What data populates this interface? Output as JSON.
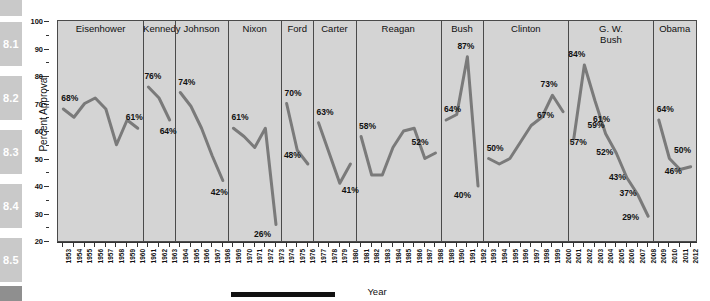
{
  "margin_tabs": [
    {
      "label": "8.1"
    },
    {
      "label": "8.2"
    },
    {
      "label": "8.3"
    },
    {
      "label": "8.4"
    },
    {
      "label": "8.5"
    }
  ],
  "chart_data": {
    "type": "line",
    "title": "",
    "xlabel": "Year",
    "ylabel": "Percent Approval",
    "ylim": [
      20,
      100
    ],
    "yticks": [
      20,
      30,
      40,
      50,
      60,
      70,
      80,
      90,
      100
    ],
    "xlim": [
      1953,
      2012
    ],
    "grid": false,
    "legend": "none",
    "line_color": "#7a7a7a",
    "panel_background": "#d4d4d4",
    "panels": [
      {
        "name": "Eisenhower",
        "start": 1953,
        "end": 1960
      },
      {
        "name": "Kennedy",
        "start": 1961,
        "end": 1963
      },
      {
        "name": "Johnson",
        "start": 1964,
        "end": 1968
      },
      {
        "name": "Nixon",
        "start": 1969,
        "end": 1973
      },
      {
        "name": "Ford",
        "start": 1974,
        "end": 1976
      },
      {
        "name": "Carter",
        "start": 1977,
        "end": 1980
      },
      {
        "name": "Reagan",
        "start": 1981,
        "end": 1988
      },
      {
        "name": "Bush",
        "start": 1989,
        "end": 1992
      },
      {
        "name": "Clinton",
        "start": 1993,
        "end": 2000
      },
      {
        "name": "G. W.\nBush",
        "start": 2001,
        "end": 2008
      },
      {
        "name": "Obama",
        "start": 2009,
        "end": 2012
      }
    ],
    "x": [
      1953,
      1954,
      1955,
      1956,
      1957,
      1958,
      1959,
      1960,
      1961,
      1962,
      1963,
      1964,
      1965,
      1966,
      1967,
      1968,
      1969,
      1970,
      1971,
      1972,
      1973,
      1974,
      1975,
      1976,
      1977,
      1978,
      1979,
      1980,
      1981,
      1982,
      1983,
      1984,
      1985,
      1986,
      1987,
      1988,
      1989,
      1990,
      1991,
      1992,
      1993,
      1994,
      1995,
      1996,
      1997,
      1998,
      1999,
      2000,
      2001,
      2002,
      2003,
      2004,
      2005,
      2006,
      2007,
      2008,
      2009,
      2010,
      2011,
      2012
    ],
    "values": [
      68,
      65,
      70,
      72,
      68,
      55,
      64,
      61,
      76,
      72,
      64,
      74,
      69,
      61,
      51,
      42,
      61,
      58,
      54,
      61,
      26,
      70,
      53,
      48,
      63,
      52,
      41,
      48,
      58,
      44,
      44,
      54,
      60,
      61,
      50,
      52,
      64,
      66,
      87,
      40,
      50,
      48,
      50,
      56,
      62,
      65,
      73,
      67,
      57,
      84,
      71,
      59,
      52,
      43,
      37,
      29,
      64,
      50,
      46,
      47
    ],
    "annotations": [
      {
        "label": "68%",
        "x": 1953,
        "y": 68
      },
      {
        "label": "61%",
        "x": 1960,
        "y": 61
      },
      {
        "label": "76%",
        "x": 1961,
        "y": 76
      },
      {
        "label": "64%",
        "x": 1963,
        "y": 64
      },
      {
        "label": "74%",
        "x": 1964,
        "y": 74
      },
      {
        "label": "42%",
        "x": 1968,
        "y": 42
      },
      {
        "label": "61%",
        "x": 1969,
        "y": 61
      },
      {
        "label": "26%",
        "x": 1973,
        "y": 26
      },
      {
        "label": "70%",
        "x": 1974,
        "y": 70
      },
      {
        "label": "48%",
        "x": 1976,
        "y": 48
      },
      {
        "label": "63%",
        "x": 1977,
        "y": 63
      },
      {
        "label": "41%",
        "x": 1979,
        "y": 41
      },
      {
        "label": "58%",
        "x": 1981,
        "y": 58
      },
      {
        "label": "52%",
        "x": 1988,
        "y": 52
      },
      {
        "label": "64%",
        "x": 1989,
        "y": 64
      },
      {
        "label": "87%",
        "x": 1991,
        "y": 87
      },
      {
        "label": "40%",
        "x": 1992,
        "y": 40
      },
      {
        "label": "50%",
        "x": 1993,
        "y": 50
      },
      {
        "label": "73%",
        "x": 1999,
        "y": 73
      },
      {
        "label": "67%",
        "x": 2000,
        "y": 67
      },
      {
        "label": "57%",
        "x": 2001,
        "y": 57
      },
      {
        "label": "84%",
        "x": 2002,
        "y": 84
      },
      {
        "label": "61%",
        "x": 2003,
        "y": 61
      },
      {
        "label": "59%",
        "x": 2004,
        "y": 59
      },
      {
        "label": "52%",
        "x": 2005,
        "y": 52
      },
      {
        "label": "43%",
        "x": 2006,
        "y": 43
      },
      {
        "label": "37%",
        "x": 2007,
        "y": 37
      },
      {
        "label": "29%",
        "x": 2008,
        "y": 29
      },
      {
        "label": "64%",
        "x": 2009,
        "y": 64
      },
      {
        "label": "50%",
        "x": 2011,
        "y": 50
      },
      {
        "label": "46%",
        "x": 2012,
        "y": 46
      }
    ]
  }
}
